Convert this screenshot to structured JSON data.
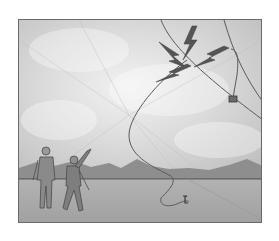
{
  "illustration": {
    "alt": "Illustration of two people flying a kite in a thunderstorm; lightning strikes the kite and travels down the string to the ground",
    "elements": [
      "storm-clouds",
      "lightning-bolts",
      "kite-string",
      "kite-key",
      "mountains",
      "ground",
      "two-people"
    ],
    "colors": {
      "sky_light": "#e6e6e6",
      "sky_mid": "#cfcfcf",
      "mountain": "#8e8e8e",
      "ground": "#a8a8a8",
      "line": "#5a5a5a",
      "frame": "#6a6a6a"
    }
  }
}
